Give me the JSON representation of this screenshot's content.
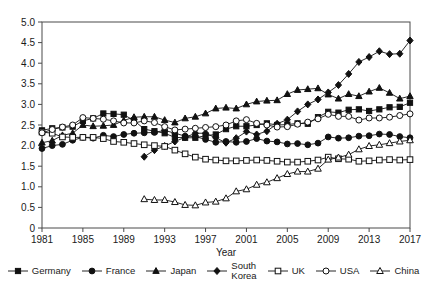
{
  "chart_data": {
    "type": "line",
    "title": "",
    "xlabel": "Year",
    "ylabel": "",
    "xlim": [
      1981,
      2017
    ],
    "ylim": [
      0,
      5.0
    ],
    "grid": false,
    "legend_position": "bottom",
    "xticks": [
      1981,
      1985,
      1989,
      1993,
      1997,
      2001,
      2005,
      2009,
      2013,
      2017
    ],
    "xtick_labels": [
      "1981",
      "1985",
      "1989",
      "1993",
      "1997",
      "2001",
      "2005",
      "2009",
      "2013",
      "2017"
    ],
    "yticks": [
      0,
      0.5,
      1.0,
      1.5,
      2.0,
      2.5,
      3.0,
      3.5,
      4.0,
      4.5,
      5.0
    ],
    "ytick_labels": [
      "0",
      "0.5",
      "1.0",
      "1.5",
      "2.0",
      "2.5",
      "3.0",
      "3.5",
      "4.0",
      "4.5",
      "5.0"
    ],
    "x": [
      1981,
      1982,
      1983,
      1984,
      1985,
      1986,
      1987,
      1988,
      1989,
      1990,
      1991,
      1992,
      1993,
      1994,
      1995,
      1996,
      1997,
      1998,
      1999,
      2000,
      2001,
      2002,
      2003,
      2004,
      2005,
      2006,
      2007,
      2008,
      2009,
      2010,
      2011,
      2012,
      2013,
      2014,
      2015,
      2016,
      2017
    ],
    "series": [
      {
        "name": "Germany",
        "marker": "filled-square",
        "x": [
          1981,
          1982,
          1983,
          1984,
          1985,
          1986,
          1987,
          1988,
          1989,
          1990,
          1991,
          1992,
          1993,
          1994,
          1995,
          1996,
          1997,
          1998,
          1999,
          2000,
          2001,
          2002,
          2003,
          2004,
          2005,
          2006,
          2007,
          2008,
          2009,
          2010,
          2011,
          2012,
          2013,
          2014,
          2015,
          2016,
          2017
        ],
        "values": [
          2.37,
          2.42,
          2.44,
          2.46,
          2.6,
          2.66,
          2.78,
          2.77,
          2.75,
          2.61,
          2.4,
          2.35,
          2.3,
          2.2,
          2.19,
          2.19,
          2.24,
          2.27,
          2.4,
          2.47,
          2.47,
          2.5,
          2.54,
          2.5,
          2.51,
          2.54,
          2.53,
          2.69,
          2.82,
          2.8,
          2.87,
          2.88,
          2.84,
          2.88,
          2.93,
          2.94,
          3.04
        ]
      },
      {
        "name": "France",
        "marker": "filled-circle",
        "x": [
          1981,
          1982,
          1983,
          1984,
          1985,
          1986,
          1987,
          1988,
          1989,
          1990,
          1991,
          1992,
          1993,
          1994,
          1995,
          1996,
          1997,
          1998,
          1999,
          2000,
          2001,
          2002,
          2003,
          2004,
          2005,
          2006,
          2007,
          2008,
          2009,
          2010,
          2011,
          2012,
          2013,
          2014,
          2015,
          2016,
          2017
        ],
        "values": [
          1.93,
          2.0,
          2.03,
          2.13,
          2.2,
          2.18,
          2.25,
          2.22,
          2.27,
          2.3,
          2.31,
          2.32,
          2.37,
          2.3,
          2.23,
          2.22,
          2.15,
          2.08,
          2.1,
          2.08,
          2.1,
          2.17,
          2.11,
          2.09,
          2.04,
          2.05,
          2.02,
          2.06,
          2.21,
          2.18,
          2.19,
          2.23,
          2.24,
          2.28,
          2.27,
          2.22,
          2.19
        ]
      },
      {
        "name": "Japan",
        "marker": "filled-triangle",
        "x": [
          1981,
          1982,
          1983,
          1984,
          1985,
          1986,
          1987,
          1988,
          1989,
          1990,
          1991,
          1992,
          1993,
          1994,
          1995,
          1996,
          1997,
          1998,
          1999,
          2000,
          2001,
          2002,
          2003,
          2004,
          2005,
          2006,
          2007,
          2008,
          2009,
          2010,
          2011,
          2012,
          2013,
          2014,
          2015,
          2016,
          2017
        ],
        "values": [
          2.07,
          2.12,
          2.25,
          2.3,
          2.5,
          2.47,
          2.48,
          2.5,
          2.61,
          2.69,
          2.7,
          2.7,
          2.62,
          2.56,
          2.66,
          2.7,
          2.78,
          2.9,
          2.92,
          2.9,
          3.0,
          3.07,
          3.09,
          3.1,
          3.25,
          3.35,
          3.37,
          3.39,
          3.24,
          3.14,
          3.25,
          3.2,
          3.31,
          3.4,
          3.28,
          3.14,
          3.2
        ]
      },
      {
        "name": "South\nKorea",
        "marker": "filled-diamond",
        "x": [
          1991,
          1992,
          1993,
          1994,
          1995,
          1996,
          1997,
          1998,
          1999,
          2000,
          2001,
          2002,
          2003,
          2004,
          2005,
          2006,
          2007,
          2008,
          2009,
          2010,
          2011,
          2012,
          2013,
          2014,
          2015,
          2016,
          2017
        ],
        "values": [
          1.73,
          1.89,
          1.99,
          2.1,
          2.2,
          2.3,
          2.3,
          2.19,
          2.07,
          2.18,
          2.34,
          2.27,
          2.35,
          2.53,
          2.63,
          2.83,
          3.0,
          3.12,
          3.29,
          3.47,
          3.74,
          4.03,
          4.15,
          4.29,
          4.22,
          4.23,
          4.55
        ]
      },
      {
        "name": "UK",
        "marker": "open-square",
        "x": [
          1981,
          1982,
          1983,
          1984,
          1985,
          1986,
          1987,
          1988,
          1989,
          1990,
          1991,
          1992,
          1993,
          1994,
          1995,
          1996,
          1997,
          1998,
          1999,
          2000,
          2001,
          2002,
          2003,
          2004,
          2005,
          2006,
          2007,
          2008,
          2009,
          2010,
          2011,
          2012,
          2013,
          2014,
          2015,
          2016,
          2017
        ],
        "values": [
          2.33,
          2.3,
          2.21,
          2.2,
          2.2,
          2.2,
          2.17,
          2.1,
          2.08,
          2.05,
          2.02,
          2.0,
          1.98,
          1.89,
          1.8,
          1.72,
          1.67,
          1.65,
          1.63,
          1.63,
          1.64,
          1.65,
          1.64,
          1.62,
          1.6,
          1.6,
          1.62,
          1.65,
          1.72,
          1.68,
          1.67,
          1.62,
          1.63,
          1.65,
          1.66,
          1.65,
          1.66
        ]
      },
      {
        "name": "USA",
        "marker": "open-circle",
        "x": [
          1981,
          1982,
          1983,
          1984,
          1985,
          1986,
          1987,
          1988,
          1989,
          1990,
          1991,
          1992,
          1993,
          1994,
          1995,
          1996,
          1997,
          1998,
          1999,
          2000,
          2001,
          2002,
          2003,
          2004,
          2005,
          2006,
          2007,
          2008,
          2009,
          2010,
          2011,
          2012,
          2013,
          2014,
          2015,
          2016,
          2017
        ],
        "values": [
          2.31,
          2.39,
          2.45,
          2.5,
          2.68,
          2.66,
          2.64,
          2.6,
          2.55,
          2.55,
          2.6,
          2.56,
          2.46,
          2.38,
          2.4,
          2.42,
          2.44,
          2.46,
          2.5,
          2.6,
          2.63,
          2.54,
          2.5,
          2.45,
          2.46,
          2.52,
          2.57,
          2.65,
          2.76,
          2.71,
          2.71,
          2.62,
          2.67,
          2.67,
          2.69,
          2.73,
          2.77
        ]
      },
      {
        "name": "China",
        "marker": "open-triangle",
        "x": [
          1991,
          1992,
          1993,
          1994,
          1995,
          1996,
          1997,
          1998,
          1999,
          2000,
          2001,
          2002,
          2003,
          2004,
          2005,
          2006,
          2007,
          2008,
          2009,
          2010,
          2011,
          2012,
          2013,
          2014,
          2015,
          2016,
          2017
        ],
        "values": [
          0.7,
          0.68,
          0.68,
          0.63,
          0.56,
          0.55,
          0.62,
          0.64,
          0.72,
          0.89,
          0.94,
          1.05,
          1.11,
          1.21,
          1.31,
          1.37,
          1.37,
          1.44,
          1.66,
          1.71,
          1.78,
          1.91,
          1.99,
          2.02,
          2.06,
          2.1,
          2.13
        ]
      }
    ]
  },
  "legend": {
    "items": [
      {
        "label": "Germany",
        "marker": "filled-square"
      },
      {
        "label": "France",
        "marker": "filled-circle"
      },
      {
        "label": "Japan",
        "marker": "filled-triangle"
      },
      {
        "label": "South\nKorea",
        "marker": "filled-diamond"
      },
      {
        "label": "UK",
        "marker": "open-square"
      },
      {
        "label": "USA",
        "marker": "open-circle"
      },
      {
        "label": "China",
        "marker": "open-triangle"
      }
    ]
  }
}
